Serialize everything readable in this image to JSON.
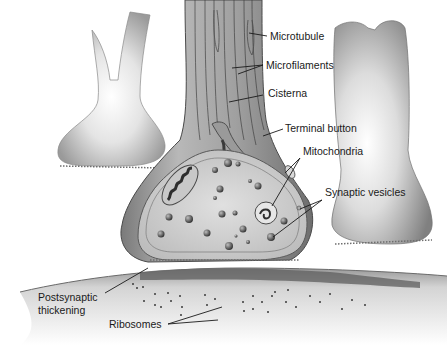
{
  "figure": {
    "type": "diagram"
  },
  "labels": {
    "microtubule": "Microtubule",
    "microfilaments": "Microfilaments",
    "cisterna": "Cisterna",
    "terminal_button": "Terminal button",
    "mitochondria": "Mitochondria",
    "synaptic_vesicles": "Synaptic vesicles",
    "postsynaptic_thickening_line1": "Postsynaptic",
    "postsynaptic_thickening_line2": "thickening",
    "ribosomes": "Ribosomes"
  },
  "colors": {
    "background": "#ffffff",
    "ink": "#1a1a1a",
    "membrane_dark": "#5a5a5a",
    "cytoplasm": "#d4d4d4",
    "highlight": "#f2f2f2"
  }
}
